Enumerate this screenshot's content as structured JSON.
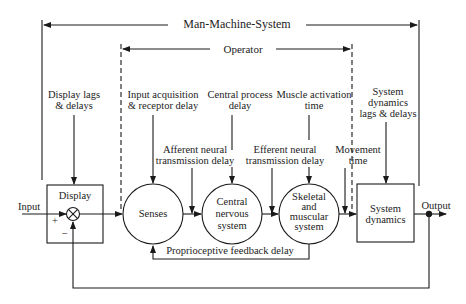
{
  "diagram": {
    "title": "Man-Machine-System",
    "operator_label": "Operator",
    "blocks": {
      "display": "Display",
      "senses": "Senses",
      "cns_line1": "Central",
      "cns_line2": "nervous",
      "cns_line3": "system",
      "skeletal_line1": "Skeletal",
      "skeletal_line2": "and",
      "skeletal_line3": "muscular",
      "skeletal_line4": "system",
      "sysdyn_line1": "System",
      "sysdyn_line2": "dynamics"
    },
    "signals": {
      "input": "Input",
      "output": "Output",
      "plus": "+",
      "minus": "−"
    },
    "delays": {
      "display_lags_1": "Display lags",
      "display_lags_2": "& delays",
      "input_acq_1": "Input acquisition",
      "input_acq_2": "& receptor delay",
      "central_proc_1": "Central process",
      "central_proc_2": "delay",
      "muscle_act_1": "Muscle activation",
      "muscle_act_2": "time",
      "afferent_1": "Afferent neural",
      "afferent_2": "transmission delay",
      "efferent_1": "Efferent neural",
      "efferent_2": "transmission delay",
      "movement_1": "Movement",
      "movement_2": "time",
      "sysdyn_lags_1": "System",
      "sysdyn_lags_2": "dynamics",
      "sysdyn_lags_3": "lags & delays",
      "proprioceptive": "Proprioceptive feedback delay"
    }
  }
}
